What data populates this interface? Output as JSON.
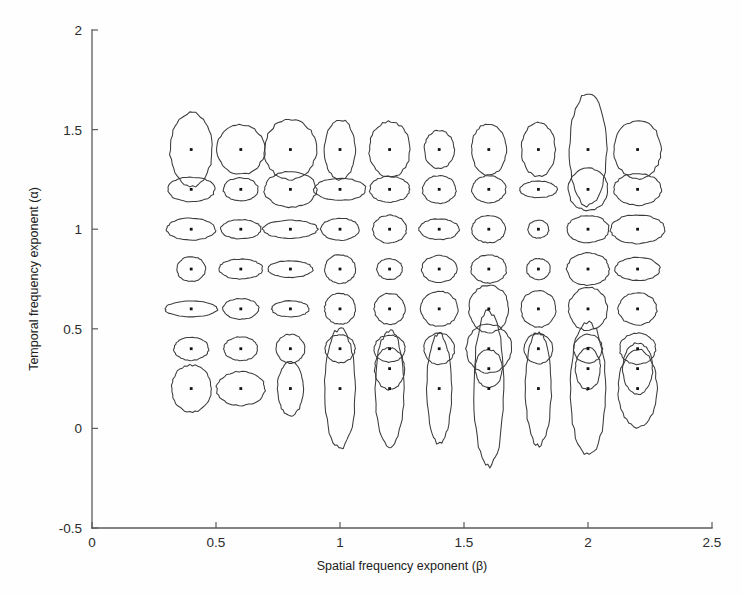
{
  "figure": {
    "background_color": "#fefefe",
    "axis_color": "#5a5a5a",
    "ellipse_color": "#3b3b3b",
    "marker_color": "#111111"
  },
  "chart_data": {
    "type": "scatter",
    "title": "",
    "xlabel": "Spatial frequency exponent (β)",
    "ylabel": "Temporal frequency exponent (α)",
    "xlim": [
      0,
      2.5
    ],
    "ylim": [
      -0.5,
      2
    ],
    "xticks": [
      0,
      0.5,
      1,
      1.5,
      2,
      2.5
    ],
    "xticklabels": [
      "0",
      "0.5",
      "1",
      "1.5",
      "2",
      "2.5"
    ],
    "yticks": [
      -0.5,
      0,
      0.5,
      1,
      1.5,
      2
    ],
    "yticklabels": [
      "-0.5",
      "0",
      "0.5",
      "1",
      "1.5",
      "2"
    ],
    "grid": false,
    "legend": null,
    "marker": "center-dot",
    "overlay": "confidence-ellipse",
    "beta_levels": [
      0.4,
      0.6,
      0.8,
      1.0,
      1.2,
      1.4,
      1.6,
      1.8,
      2.0,
      2.2
    ],
    "alpha_levels": [
      1.4,
      1.2,
      1.0,
      0.8,
      0.6,
      0.4,
      0.2
    ],
    "note": "Each grid point is a stimulus condition (beta, alpha); the outline is the fitted confidence ellipse around the estimated exponent pair, its semi-axes (rx, ry) given in data units.",
    "points": [
      {
        "beta": 0.4,
        "alpha": 1.4,
        "rx": 0.085,
        "ry": 0.185
      },
      {
        "beta": 0.6,
        "alpha": 1.4,
        "rx": 0.095,
        "ry": 0.125
      },
      {
        "beta": 0.8,
        "alpha": 1.4,
        "rx": 0.105,
        "ry": 0.15
      },
      {
        "beta": 1.0,
        "alpha": 1.4,
        "rx": 0.062,
        "ry": 0.15
      },
      {
        "beta": 1.2,
        "alpha": 1.4,
        "rx": 0.082,
        "ry": 0.14
      },
      {
        "beta": 1.4,
        "alpha": 1.4,
        "rx": 0.06,
        "ry": 0.095
      },
      {
        "beta": 1.6,
        "alpha": 1.4,
        "rx": 0.07,
        "ry": 0.13
      },
      {
        "beta": 1.8,
        "alpha": 1.4,
        "rx": 0.068,
        "ry": 0.135
      },
      {
        "beta": 2.0,
        "alpha": 1.4,
        "rx": 0.075,
        "ry": 0.28
      },
      {
        "beta": 2.2,
        "alpha": 1.4,
        "rx": 0.095,
        "ry": 0.145
      },
      {
        "beta": 0.4,
        "alpha": 1.2,
        "rx": 0.095,
        "ry": 0.062
      },
      {
        "beta": 0.6,
        "alpha": 1.2,
        "rx": 0.07,
        "ry": 0.058
      },
      {
        "beta": 0.8,
        "alpha": 1.2,
        "rx": 0.105,
        "ry": 0.09
      },
      {
        "beta": 1.0,
        "alpha": 1.2,
        "rx": 0.105,
        "ry": 0.055
      },
      {
        "beta": 1.2,
        "alpha": 1.2,
        "rx": 0.08,
        "ry": 0.065
      },
      {
        "beta": 1.4,
        "alpha": 1.2,
        "rx": 0.068,
        "ry": 0.07
      },
      {
        "beta": 1.6,
        "alpha": 1.2,
        "rx": 0.068,
        "ry": 0.068
      },
      {
        "beta": 1.8,
        "alpha": 1.2,
        "rx": 0.075,
        "ry": 0.042
      },
      {
        "beta": 2.0,
        "alpha": 1.2,
        "rx": 0.08,
        "ry": 0.105
      },
      {
        "beta": 2.2,
        "alpha": 1.2,
        "rx": 0.095,
        "ry": 0.08
      },
      {
        "beta": 0.4,
        "alpha": 1.0,
        "rx": 0.098,
        "ry": 0.055
      },
      {
        "beta": 0.6,
        "alpha": 1.0,
        "rx": 0.082,
        "ry": 0.048
      },
      {
        "beta": 0.8,
        "alpha": 1.0,
        "rx": 0.11,
        "ry": 0.045
      },
      {
        "beta": 1.0,
        "alpha": 1.0,
        "rx": 0.078,
        "ry": 0.055
      },
      {
        "beta": 1.2,
        "alpha": 1.0,
        "rx": 0.068,
        "ry": 0.07
      },
      {
        "beta": 1.4,
        "alpha": 1.0,
        "rx": 0.08,
        "ry": 0.052
      },
      {
        "beta": 1.6,
        "alpha": 1.0,
        "rx": 0.068,
        "ry": 0.068
      },
      {
        "beta": 1.8,
        "alpha": 1.0,
        "rx": 0.042,
        "ry": 0.045
      },
      {
        "beta": 2.0,
        "alpha": 1.0,
        "rx": 0.085,
        "ry": 0.068
      },
      {
        "beta": 2.2,
        "alpha": 1.0,
        "rx": 0.11,
        "ry": 0.072
      },
      {
        "beta": 0.4,
        "alpha": 0.8,
        "rx": 0.058,
        "ry": 0.062
      },
      {
        "beta": 0.6,
        "alpha": 0.8,
        "rx": 0.088,
        "ry": 0.05
      },
      {
        "beta": 0.8,
        "alpha": 0.8,
        "rx": 0.09,
        "ry": 0.042
      },
      {
        "beta": 1.0,
        "alpha": 0.8,
        "rx": 0.062,
        "ry": 0.072
      },
      {
        "beta": 1.2,
        "alpha": 0.8,
        "rx": 0.052,
        "ry": 0.052
      },
      {
        "beta": 1.4,
        "alpha": 0.8,
        "rx": 0.07,
        "ry": 0.068
      },
      {
        "beta": 1.6,
        "alpha": 0.8,
        "rx": 0.072,
        "ry": 0.07
      },
      {
        "beta": 1.8,
        "alpha": 0.8,
        "rx": 0.048,
        "ry": 0.052
      },
      {
        "beta": 2.0,
        "alpha": 0.8,
        "rx": 0.085,
        "ry": 0.082
      },
      {
        "beta": 2.2,
        "alpha": 0.8,
        "rx": 0.09,
        "ry": 0.058
      },
      {
        "beta": 0.4,
        "alpha": 0.6,
        "rx": 0.105,
        "ry": 0.04
      },
      {
        "beta": 0.6,
        "alpha": 0.6,
        "rx": 0.072,
        "ry": 0.052
      },
      {
        "beta": 0.8,
        "alpha": 0.6,
        "rx": 0.075,
        "ry": 0.04
      },
      {
        "beta": 1.0,
        "alpha": 0.6,
        "rx": 0.062,
        "ry": 0.078
      },
      {
        "beta": 1.2,
        "alpha": 0.6,
        "rx": 0.062,
        "ry": 0.078
      },
      {
        "beta": 1.4,
        "alpha": 0.6,
        "rx": 0.075,
        "ry": 0.088
      },
      {
        "beta": 1.6,
        "alpha": 0.6,
        "rx": 0.08,
        "ry": 0.12
      },
      {
        "beta": 1.8,
        "alpha": 0.6,
        "rx": 0.07,
        "ry": 0.092
      },
      {
        "beta": 2.0,
        "alpha": 0.6,
        "rx": 0.078,
        "ry": 0.108
      },
      {
        "beta": 2.2,
        "alpha": 0.6,
        "rx": 0.078,
        "ry": 0.08
      },
      {
        "beta": 0.4,
        "alpha": 0.4,
        "rx": 0.07,
        "ry": 0.058
      },
      {
        "beta": 0.6,
        "alpha": 0.4,
        "rx": 0.068,
        "ry": 0.06
      },
      {
        "beta": 0.8,
        "alpha": 0.4,
        "rx": 0.058,
        "ry": 0.072
      },
      {
        "beta": 1.0,
        "alpha": 0.4,
        "rx": 0.06,
        "ry": 0.07
      },
      {
        "beta": 1.2,
        "alpha": 0.4,
        "rx": 0.062,
        "ry": 0.068
      },
      {
        "beta": 1.4,
        "alpha": 0.4,
        "rx": 0.062,
        "ry": 0.078
      },
      {
        "beta": 1.6,
        "alpha": 0.4,
        "rx": 0.092,
        "ry": 0.122
      },
      {
        "beta": 1.8,
        "alpha": 0.4,
        "rx": 0.058,
        "ry": 0.075
      },
      {
        "beta": 2.0,
        "alpha": 0.4,
        "rx": 0.058,
        "ry": 0.072
      },
      {
        "beta": 2.2,
        "alpha": 0.4,
        "rx": 0.072,
        "ry": 0.078
      },
      {
        "beta": 0.4,
        "alpha": 0.2,
        "rx": 0.08,
        "ry": 0.118
      },
      {
        "beta": 0.6,
        "alpha": 0.2,
        "rx": 0.098,
        "ry": 0.085
      },
      {
        "beta": 0.8,
        "alpha": 0.2,
        "rx": 0.052,
        "ry": 0.135
      },
      {
        "beta": 1.0,
        "alpha": 0.2,
        "rx": 0.062,
        "ry": 0.3
      },
      {
        "beta": 1.2,
        "alpha": 0.2,
        "rx": 0.058,
        "ry": 0.29
      },
      {
        "beta": 1.4,
        "alpha": 0.2,
        "rx": 0.05,
        "ry": 0.275
      },
      {
        "beta": 1.6,
        "alpha": 0.2,
        "rx": 0.06,
        "ry": 0.39
      },
      {
        "beta": 1.8,
        "alpha": 0.2,
        "rx": 0.052,
        "ry": 0.285
      },
      {
        "beta": 2.0,
        "alpha": 0.2,
        "rx": 0.072,
        "ry": 0.33
      },
      {
        "beta": 2.2,
        "alpha": 0.2,
        "rx": 0.078,
        "ry": 0.195
      },
      {
        "beta": 1.2,
        "alpha": 0.3,
        "rx": 0.06,
        "ry": 0.105
      },
      {
        "beta": 1.6,
        "alpha": 0.3,
        "rx": 0.055,
        "ry": 0.095
      },
      {
        "beta": 2.0,
        "alpha": 0.3,
        "rx": 0.05,
        "ry": 0.105
      },
      {
        "beta": 2.2,
        "alpha": 0.3,
        "rx": 0.06,
        "ry": 0.13
      }
    ]
  }
}
